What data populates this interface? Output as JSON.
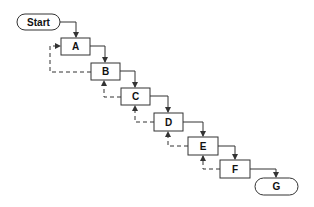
{
  "diagram": {
    "type": "flowchart-waterfall",
    "colors": {
      "background": "#ffffff",
      "stroke": "#333333",
      "text": "#111111"
    },
    "nodes": [
      {
        "id": "start",
        "label": "Start",
        "shape": "terminal",
        "x": 17,
        "y": 14,
        "w": 43,
        "h": 16
      },
      {
        "id": "a",
        "label": "A",
        "shape": "process",
        "x": 61,
        "y": 38,
        "w": 29,
        "h": 17
      },
      {
        "id": "b",
        "label": "B",
        "shape": "process",
        "x": 91,
        "y": 63,
        "w": 29,
        "h": 17
      },
      {
        "id": "c",
        "label": "C",
        "shape": "process",
        "x": 121,
        "y": 88,
        "w": 29,
        "h": 17
      },
      {
        "id": "d",
        "label": "D",
        "shape": "process",
        "x": 154,
        "y": 113,
        "w": 29,
        "h": 18
      },
      {
        "id": "e",
        "label": "E",
        "shape": "process",
        "x": 188,
        "y": 137,
        "w": 30,
        "h": 18
      },
      {
        "id": "f",
        "label": "F",
        "shape": "process",
        "x": 220,
        "y": 160,
        "w": 30,
        "h": 18
      },
      {
        "id": "g",
        "label": "G",
        "shape": "terminal",
        "x": 255,
        "y": 178,
        "w": 43,
        "h": 17
      }
    ],
    "edges": [
      {
        "from": "start",
        "to": "a",
        "style": "solid"
      },
      {
        "from": "a",
        "to": "b",
        "style": "solid"
      },
      {
        "from": "b",
        "to": "c",
        "style": "solid"
      },
      {
        "from": "c",
        "to": "d",
        "style": "solid"
      },
      {
        "from": "d",
        "to": "e",
        "style": "solid"
      },
      {
        "from": "e",
        "to": "f",
        "style": "solid"
      },
      {
        "from": "f",
        "to": "g",
        "style": "solid"
      },
      {
        "from": "b",
        "to": "a",
        "style": "dashed"
      },
      {
        "from": "c",
        "to": "b",
        "style": "dashed"
      },
      {
        "from": "d",
        "to": "c",
        "style": "dashed"
      },
      {
        "from": "e",
        "to": "d",
        "style": "dashed"
      },
      {
        "from": "f",
        "to": "e",
        "style": "dashed"
      }
    ]
  }
}
